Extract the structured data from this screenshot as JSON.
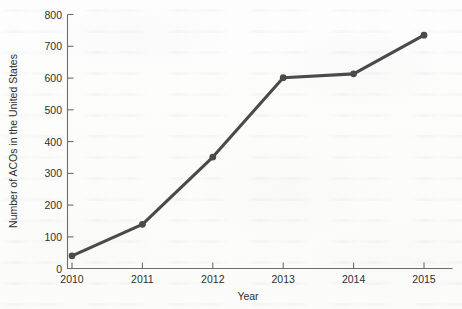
{
  "figure": {
    "background_color": "#fdfdfd",
    "ink_color": "#4a4a4a",
    "axis_color": "#6d6d6d"
  },
  "chart_data": {
    "type": "line",
    "title": "",
    "subtitle": "",
    "xlabel": "Year",
    "ylabel": "Number of ACOs in the United States",
    "categories": [
      "2010",
      "2011",
      "2012",
      "2013",
      "2014",
      "2015"
    ],
    "x": [
      2010,
      2011,
      2012,
      2013,
      2014,
      2015
    ],
    "values": [
      40,
      139,
      351,
      601,
      613,
      735
    ],
    "series": [
      {
        "name": "Number of ACOs in the United States",
        "values": [
          40,
          139,
          351,
          601,
          613,
          735
        ]
      }
    ],
    "xlim": [
      2009.7,
      2015.3
    ],
    "ylim": [
      0,
      800
    ],
    "y_ticks": [
      0,
      100,
      200,
      300,
      400,
      500,
      600,
      700,
      800
    ],
    "y_tick_labels": [
      "0",
      "100",
      "200",
      "300",
      "400",
      "500",
      "600",
      "700",
      "800"
    ],
    "x_ticks": [
      2010,
      2011,
      2012,
      2013,
      2014,
      2015
    ],
    "x_tick_labels": [
      "2010",
      "2011",
      "2012",
      "2013",
      "2014",
      "2015"
    ],
    "grid": false,
    "legend": false,
    "legend_position": "none",
    "marker": "circle",
    "line_color": "#4a4a4a",
    "annotations": []
  }
}
